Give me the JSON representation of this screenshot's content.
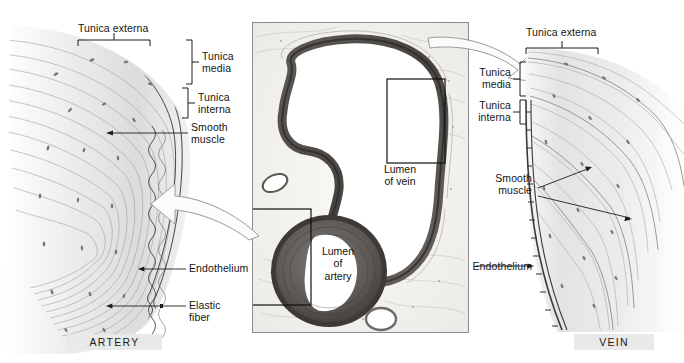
{
  "figure": {
    "background_color": "#ffffff",
    "panels": [
      "artery",
      "micrograph",
      "vein"
    ]
  },
  "artery_panel": {
    "caption": "ARTERY",
    "caption_bg": "#e9e9e9",
    "labels": {
      "tunica_externa": "Tunica externa",
      "tunica_media": "Tunica\nmedia",
      "tunica_interna": "Tunica\ninterna",
      "smooth_muscle": "Smooth\nmuscle",
      "endothelium": "Endothelium",
      "elastic_fiber": "Elastic\nfiber"
    }
  },
  "micrograph": {
    "lumen_of_vein": "Lumen\nof vein",
    "lumen_of_artery": "Lumen\nof\nartery",
    "callout_boxes": [
      "vein-wall-callout",
      "artery-wall-callout"
    ],
    "border_color": "#8c8c8c"
  },
  "vein_panel": {
    "caption": "VEIN",
    "caption_bg": "#e9e9e9",
    "labels": {
      "tunica_externa": "Tunica externa",
      "tunica_media": "Tunica\nmedia",
      "tunica_interna": "Tunica\ninterna",
      "smooth_muscle": "Smooth\nmuscle",
      "endothelium": "Endothelium"
    }
  },
  "arrows": {
    "left_arrow_name": "artery-magnify-arrow",
    "right_arrow_name": "vein-magnify-arrow"
  }
}
